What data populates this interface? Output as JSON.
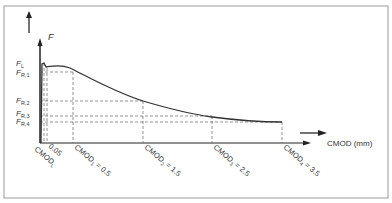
{
  "diagram": {
    "y_axis_label": "F",
    "x_axis_label": "CMOD (mm)",
    "force_labels": [
      {
        "main": "F",
        "sub": "L"
      },
      {
        "main": "F",
        "sub": "R,1"
      },
      {
        "main": "F",
        "sub": "R,2"
      },
      {
        "main": "F",
        "sub": "R,3"
      },
      {
        "main": "F",
        "sub": "R,4"
      }
    ],
    "cmod_labels": [
      {
        "main": "CMOD",
        "sub": "L",
        "suffix": ""
      },
      {
        "main": "0.05",
        "sub": "",
        "suffix": ""
      },
      {
        "main": "CMOD",
        "sub": "1",
        "suffix": " = 0.5"
      },
      {
        "main": "CMOD",
        "sub": "2",
        "suffix": " = 1.5"
      },
      {
        "main": "CMOD",
        "sub": "3",
        "suffix": " = 2.5"
      },
      {
        "main": "CMOD",
        "sub": "4",
        "suffix": " = 3.5"
      }
    ],
    "colors": {
      "line": "#333333",
      "dash": "#555555",
      "frame": "#888888"
    }
  }
}
